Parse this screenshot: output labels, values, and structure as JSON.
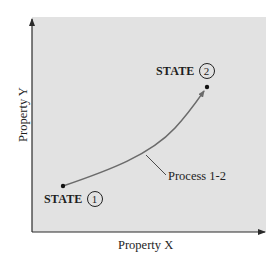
{
  "diagram": {
    "x_axis_label": "Property X",
    "y_axis_label": "Property Y",
    "states": [
      {
        "label": "STATE",
        "number": "1",
        "x": 63,
        "y": 186
      },
      {
        "label": "STATE",
        "number": "2",
        "x": 207,
        "y": 87
      }
    ],
    "process_label": "Process 1-2",
    "colors": {
      "plot_background": "#e2e2e2",
      "curve": "#6b6b6b",
      "axis": "#2a2a2a",
      "text": "#1e1e1e"
    }
  }
}
